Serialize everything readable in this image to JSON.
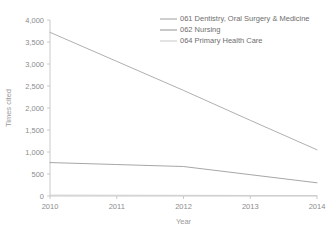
{
  "chart_data": {
    "type": "line",
    "title": "",
    "xlabel": "Year",
    "ylabel": "Times cited",
    "x": [
      2010,
      2011,
      2012,
      2013,
      2014
    ],
    "xtick_labels": [
      "2010",
      "2011",
      "2012",
      "2013",
      "2014"
    ],
    "ytick_labels": [
      "0",
      "500",
      "1,000",
      "1,500",
      "2,000",
      "2,500",
      "3,000",
      "3,500",
      "4,000"
    ],
    "ytick_values": [
      0,
      500,
      1000,
      1500,
      2000,
      2500,
      3000,
      3500,
      4000
    ],
    "ylim": [
      0,
      4000
    ],
    "xlim": [
      2010,
      2014
    ],
    "grid": false,
    "legend_position": "top-right",
    "series": [
      {
        "name": "061 Dentistry, Oral Surgery & Medicine",
        "color": "#a6a6a6",
        "values": [
          3720,
          3060,
          2400,
          1720,
          1050
        ]
      },
      {
        "name": "062 Nursing",
        "color": "#9c9c9c",
        "values": [
          760,
          715,
          670,
          485,
          300
        ]
      },
      {
        "name": "064 Primary Health Care",
        "color": "#cccccc",
        "values": [
          20,
          18,
          15,
          12,
          10
        ]
      }
    ]
  },
  "axes": {
    "y_axis_title": "Times cited",
    "x_axis_title": "Year"
  },
  "legend": {
    "entries": [
      {
        "label": "061 Dentistry, Oral Surgery & Medicine"
      },
      {
        "label": "062 Nursing"
      },
      {
        "label": "064 Primary Health Care"
      }
    ]
  },
  "colors": {
    "axis": "#bdbdbd",
    "text": "#8c8c8c",
    "background": "#ffffff"
  }
}
